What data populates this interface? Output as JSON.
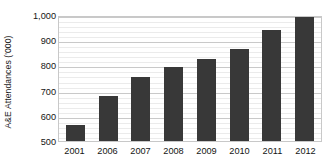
{
  "chart_data": {
    "type": "bar",
    "title": "",
    "xlabel": "",
    "ylabel": "A&E Attendances ('000)",
    "categories": [
      "2001",
      "2006",
      "2007",
      "2008",
      "2009",
      "2010",
      "2011",
      "2012"
    ],
    "values": [
      565,
      680,
      755,
      795,
      825,
      865,
      940,
      995
    ],
    "series": [
      {
        "name": "A&E Attendances ('000)",
        "values": [
          565,
          680,
          755,
          795,
          825,
          865,
          940,
          995
        ]
      }
    ],
    "ylim": [
      500,
      1000
    ],
    "y_ticks": [
      500,
      600,
      700,
      800,
      900,
      1000
    ],
    "y_tick_labels": [
      "500",
      "600",
      "700",
      "800",
      "900",
      "1,000"
    ],
    "grid": true,
    "minor_grid": true,
    "legend": false,
    "legend_position": "none",
    "bar_color": "#383838",
    "gridline_color": "#c9c9c9",
    "minor_gridline_color": "#ebebeb",
    "plot_border_color": "#c8c8c8",
    "background_color": "#ffffff"
  }
}
